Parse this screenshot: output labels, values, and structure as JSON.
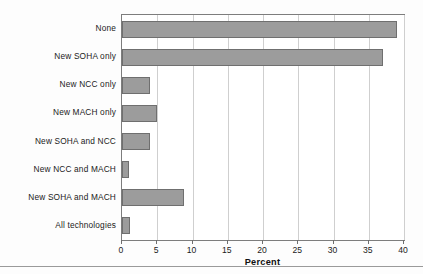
{
  "chart_data": {
    "type": "bar",
    "orientation": "horizontal",
    "title": "",
    "xlabel": "Percent",
    "ylabel": "",
    "xlim": [
      0,
      40
    ],
    "xticks": [
      0,
      5,
      10,
      15,
      20,
      25,
      30,
      35,
      40
    ],
    "xtick_labels": [
      "0",
      "5",
      "10",
      "15",
      "20",
      "25",
      "30",
      "35",
      "40"
    ],
    "grid": "vertical",
    "legend": "none",
    "categories": [
      "None",
      "New SOHA only",
      "New NCC only",
      "New MACH only",
      "New SOHA and NCC",
      "New NCC and MACH",
      "New SOHA and MACH",
      "All technologies"
    ],
    "values": [
      39,
      37,
      4,
      5,
      4,
      1,
      8.8,
      1.1
    ],
    "bar_color": "#9c9c9c",
    "bar_edge_color": "#6f6f6f",
    "gridline_color": "#cfcfcf",
    "axis_color": "#7d7d7d",
    "text_color": "#1b1b1b"
  }
}
